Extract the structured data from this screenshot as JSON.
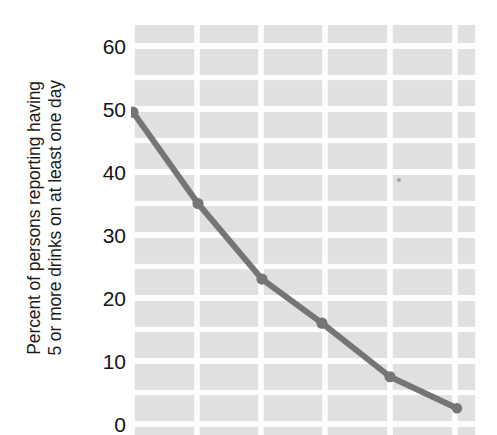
{
  "figure": {
    "background_color": "#ffffff",
    "plot_background_color": "#e0e0e0",
    "gridline_color": "#ffffff",
    "series_color": "#6e6e6e",
    "tick_text_color": "#141414",
    "axis_title_color": "#1b1b1b"
  },
  "axis_title": {
    "line1": "Percent of persons reporting having",
    "line2": "5 or more drinks on at least one day"
  },
  "y_ticks": [
    {
      "label": "60",
      "value": 60
    },
    {
      "label": "50",
      "value": 50
    },
    {
      "label": "40",
      "value": 40
    },
    {
      "label": "30",
      "value": 30
    },
    {
      "label": "20",
      "value": 20
    },
    {
      "label": "10",
      "value": 10
    },
    {
      "label": "0",
      "value": 0
    }
  ],
  "chart_data": {
    "type": "line",
    "title": "",
    "subtitle": "",
    "xlabel": "",
    "ylabel": "Percent of persons reporting having 5 or more drinks on at least one day",
    "ylim": [
      0,
      63
    ],
    "ytick_values": [
      0,
      10,
      20,
      30,
      40,
      50,
      60
    ],
    "ytick_labels": [
      "0",
      "10",
      "20",
      "30",
      "40",
      "50",
      "60"
    ],
    "xlim": [
      0,
      6
    ],
    "xtick_values": [],
    "xtick_labels": [],
    "grid": true,
    "grid_color": "#ffffff",
    "legend": false,
    "legend_position": "none",
    "annotations": [],
    "series": [
      {
        "name": "Percent reporting 5 or more drinks on at least one day",
        "color": "#6e6e6e",
        "marker": "circle",
        "line_width": 6,
        "x": [
          0,
          1,
          2,
          3,
          4,
          5
        ],
        "values": [
          49.5,
          35,
          23,
          16,
          7.5,
          2.5
        ]
      }
    ]
  }
}
